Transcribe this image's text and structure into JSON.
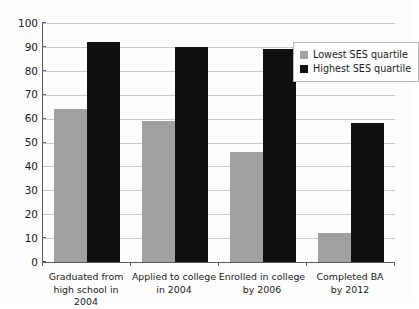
{
  "chart_data": {
    "type": "bar",
    "title": "",
    "subtitle": "",
    "xlabel": "",
    "ylabel": "",
    "ylim": [
      0,
      100
    ],
    "ytick_step": 10,
    "yticks": [
      100,
      90,
      80,
      70,
      60,
      50,
      40,
      30,
      20,
      10,
      0
    ],
    "grid": true,
    "legend_position": "top-right inside plot",
    "categories": [
      "Graduated from high school in 2004",
      "Applied to college in 2004",
      "Enrolled in college by 2006",
      "Completed BA by 2012"
    ],
    "category_lines": [
      [
        "Graduated from",
        "high school in 2004"
      ],
      [
        "Applied to college",
        "in 2004"
      ],
      [
        "Enrolled in college",
        "by 2006"
      ],
      [
        "Completed BA",
        "by 2012"
      ]
    ],
    "series": [
      {
        "name": "Lowest SES quartile",
        "color": "#a0a0a0",
        "values": [
          64,
          59,
          46,
          12
        ]
      },
      {
        "name": "Highest SES quartile",
        "color": "#101010",
        "values": [
          92,
          90,
          89,
          58
        ]
      }
    ]
  },
  "colors": {
    "lowest_ses": "#a0a0a0",
    "highest_ses": "#101010",
    "axis": "#5a5a5a",
    "gridline": "#c9c9c9",
    "background": "#fdfdfd",
    "text": "#1a1a1a"
  }
}
